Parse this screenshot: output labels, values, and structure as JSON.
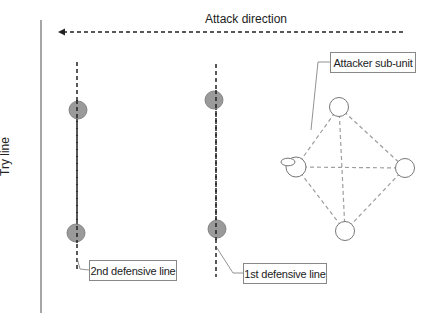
{
  "diagram": {
    "attack_direction_label": "Attack direction",
    "try_line_label": "Try line",
    "callouts": {
      "attacker_sub_unit": "Attacker sub-unit",
      "second_defensive_line": "2nd defensive line",
      "first_defensive_line": "1st defensive line"
    },
    "colors": {
      "defender_fill": "#9a9a9a",
      "attacker_stroke": "#777777",
      "dashed_link": "#9e9e9e",
      "line": "#222222"
    },
    "defenders": [
      {
        "line": "2nd",
        "x": 78,
        "y": 110
      },
      {
        "line": "2nd",
        "x": 76,
        "y": 233
      },
      {
        "line": "1st",
        "x": 214,
        "y": 100
      },
      {
        "line": "1st",
        "x": 217,
        "y": 229
      }
    ],
    "attackers": [
      {
        "position": "top",
        "x": 339,
        "y": 107
      },
      {
        "position": "left",
        "x": 296,
        "y": 167,
        "has_ball": true
      },
      {
        "position": "right",
        "x": 405,
        "y": 168
      },
      {
        "position": "bottom",
        "x": 345,
        "y": 231
      }
    ]
  }
}
